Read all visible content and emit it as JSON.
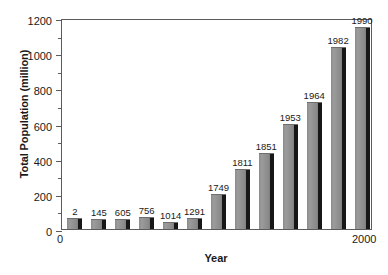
{
  "chart_data": {
    "type": "bar",
    "title": "",
    "xlabel": "Year",
    "ylabel": "Total Population (million)",
    "categories": [
      "2",
      "145",
      "605",
      "756",
      "1014",
      "1291",
      "1749",
      "1811",
      "1851",
      "1953",
      "1964",
      "1982",
      "1990"
    ],
    "values": [
      62,
      56,
      56,
      68,
      40,
      62,
      200,
      340,
      430,
      595,
      720,
      1035,
      1150
    ],
    "ylim": [
      0,
      1200
    ],
    "xlim": [
      0,
      2000
    ],
    "y_major_ticks": [
      0,
      200,
      400,
      600,
      800,
      1000,
      1200
    ],
    "y_minor_ticks": [
      100,
      300,
      500,
      700,
      900,
      1100
    ],
    "x_tick_labels": [
      "0",
      "2000"
    ],
    "grid": false,
    "legend": null,
    "bar_label_position": "above",
    "colors": {
      "bar_face": "#8e8e8e",
      "bar_side": "#171717",
      "axis": "#5b5b5b",
      "text": "#1a1a1a",
      "background": "#ffffff"
    }
  },
  "axes": {
    "y_ticks": [
      {
        "label": "1200",
        "value": 1200
      },
      {
        "label": "1000",
        "value": 1000
      },
      {
        "label": "800",
        "value": 800
      },
      {
        "label": "600",
        "value": 600
      },
      {
        "label": "400",
        "value": 400
      },
      {
        "label": "200",
        "value": 200
      },
      {
        "label": "0",
        "value": 0
      }
    ],
    "y_minor": [
      1100,
      900,
      700,
      500,
      300,
      100
    ],
    "x_left_label": "0",
    "x_right_label": "2000"
  },
  "caption_remnant": ""
}
